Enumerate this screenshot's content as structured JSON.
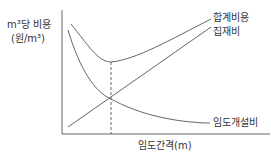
{
  "diagram": {
    "y_axis_label_line1": "m³당 비용",
    "y_axis_label_line2": "(원/m³)",
    "x_axis_label": "임도간격(m)",
    "curves": [
      {
        "name": "total",
        "label": "합계비용"
      },
      {
        "name": "collection",
        "label": "집재비"
      },
      {
        "name": "road",
        "label": "임도개설비"
      }
    ],
    "optimum_marker": "dashed vertical line at minimum of total cost (intersection of collection and road costs)",
    "colors": {
      "line": "#555555",
      "text": "#333333"
    }
  }
}
